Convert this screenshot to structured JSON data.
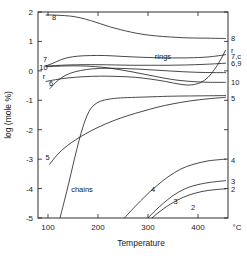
{
  "chart_data": {
    "type": "line",
    "title": "",
    "xlabel": "Temperature",
    "ylabel": "log (mole %)",
    "x_unit": "°C",
    "xlim": [
      80,
      460
    ],
    "ylim": [
      -5,
      2
    ],
    "grid": false,
    "legend_position": "curve-end-labels",
    "xticks": [
      100,
      200,
      300,
      400
    ],
    "xtick_labels": [
      "100",
      "200",
      "300",
      "400"
    ],
    "yticks": [
      2,
      1,
      0,
      -1,
      -2,
      -3,
      -4,
      -5
    ],
    "ytick_labels": [
      "2",
      "1",
      "0",
      "-1",
      "-2",
      "-3",
      "-4",
      "-5"
    ],
    "annotations": [
      {
        "text": "8",
        "x": 112,
        "y": 1.72
      },
      {
        "text": "rings",
        "x": 330,
        "y": 0.4
      },
      {
        "text": "chains",
        "x": 168,
        "y": -4.12
      },
      {
        "text": "7",
        "x": 94,
        "y": 0.3
      },
      {
        "text": "10",
        "x": 91,
        "y": 0.02
      },
      {
        "text": "r",
        "x": 92,
        "y": -0.28
      },
      {
        "text": "6",
        "x": 106,
        "y": -0.52
      },
      {
        "text": "5",
        "x": 99,
        "y": -3.02
      },
      {
        "text": "4",
        "x": 310,
        "y": -4.1
      },
      {
        "text": "3",
        "x": 355,
        "y": -4.54
      },
      {
        "text": "2",
        "x": 390,
        "y": -4.72
      }
    ],
    "right_edge_labels": [
      {
        "text": "8",
        "y": 1.1
      },
      {
        "text": "r",
        "y": 0.72
      },
      {
        "text": "7,c",
        "y": 0.52
      },
      {
        "text": "6,9",
        "y": 0.26
      },
      {
        "text": "10",
        "y": -0.38
      },
      {
        "text": "5",
        "y": -0.92
      },
      {
        "text": "4",
        "y": -3.02
      },
      {
        "text": "3",
        "y": -3.74
      },
      {
        "text": "2",
        "y": -4.02
      }
    ],
    "series": [
      {
        "name": "8",
        "label": "8",
        "points": [
          [
            96,
            1.9
          ],
          [
            120,
            1.89
          ],
          [
            145,
            1.86
          ],
          [
            165,
            1.8
          ],
          [
            185,
            1.71
          ],
          [
            205,
            1.6
          ],
          [
            225,
            1.49
          ],
          [
            245,
            1.4
          ],
          [
            265,
            1.32
          ],
          [
            290,
            1.24
          ],
          [
            315,
            1.19
          ],
          [
            345,
            1.15
          ],
          [
            380,
            1.12
          ],
          [
            420,
            1.11
          ],
          [
            455,
            1.1
          ]
        ]
      },
      {
        "name": "7,c",
        "label": "7,c",
        "points": [
          [
            96,
            0.17
          ],
          [
            110,
            0.26
          ],
          [
            125,
            0.37
          ],
          [
            140,
            0.45
          ],
          [
            160,
            0.5
          ],
          [
            185,
            0.52
          ],
          [
            215,
            0.52
          ],
          [
            250,
            0.49
          ],
          [
            290,
            0.46
          ],
          [
            330,
            0.44
          ],
          [
            370,
            0.44
          ],
          [
            410,
            0.46
          ],
          [
            435,
            0.5
          ],
          [
            455,
            0.55
          ]
        ]
      },
      {
        "name": "6,9",
        "label": "6,9",
        "points": [
          [
            96,
            0.16
          ],
          [
            115,
            0.18
          ],
          [
            140,
            0.2
          ],
          [
            170,
            0.21
          ],
          [
            200,
            0.21
          ],
          [
            235,
            0.2
          ],
          [
            270,
            0.19
          ],
          [
            305,
            0.19
          ],
          [
            340,
            0.19
          ],
          [
            375,
            0.2
          ],
          [
            410,
            0.22
          ],
          [
            435,
            0.24
          ],
          [
            455,
            0.26
          ]
        ]
      },
      {
        "name": "10",
        "label": "10",
        "points": [
          [
            96,
            0.14
          ],
          [
            120,
            0.16
          ],
          [
            150,
            0.17
          ],
          [
            180,
            0.16
          ],
          [
            210,
            0.12
          ],
          [
            240,
            0.05
          ],
          [
            270,
            -0.04
          ],
          [
            300,
            -0.14
          ],
          [
            330,
            -0.24
          ],
          [
            360,
            -0.32
          ],
          [
            395,
            -0.37
          ],
          [
            425,
            -0.39
          ],
          [
            455,
            -0.39
          ]
        ]
      },
      {
        "name": "6",
        "label": "6",
        "points": [
          [
            104,
            -0.6
          ],
          [
            115,
            -0.4
          ],
          [
            128,
            -0.22
          ],
          [
            145,
            -0.08
          ],
          [
            165,
            0.01
          ],
          [
            190,
            0.07
          ],
          [
            220,
            0.09
          ],
          [
            250,
            0.08
          ],
          [
            280,
            0.06
          ],
          [
            310,
            0.03
          ],
          [
            340,
            0.0
          ],
          [
            370,
            -0.03
          ],
          [
            400,
            -0.05
          ],
          [
            430,
            -0.06
          ],
          [
            455,
            -0.06
          ]
        ]
      },
      {
        "name": "5",
        "label": "5",
        "points": [
          [
            103,
            -3.18
          ],
          [
            115,
            -2.92
          ],
          [
            130,
            -2.66
          ],
          [
            150,
            -2.4
          ],
          [
            175,
            -2.14
          ],
          [
            200,
            -1.92
          ],
          [
            230,
            -1.7
          ],
          [
            260,
            -1.52
          ],
          [
            290,
            -1.37
          ],
          [
            320,
            -1.23
          ],
          [
            350,
            -1.12
          ],
          [
            385,
            -1.02
          ],
          [
            420,
            -0.95
          ],
          [
            455,
            -0.9
          ]
        ]
      },
      {
        "name": "chains",
        "label": "chains",
        "points": [
          [
            124,
            -5.0
          ],
          [
            133,
            -4.4
          ],
          [
            142,
            -3.78
          ],
          [
            150,
            -3.2
          ],
          [
            158,
            -2.64
          ],
          [
            166,
            -2.12
          ],
          [
            174,
            -1.7
          ],
          [
            182,
            -1.38
          ],
          [
            192,
            -1.16
          ],
          [
            205,
            -1.03
          ],
          [
            222,
            -0.96
          ],
          [
            245,
            -0.92
          ],
          [
            275,
            -0.9
          ],
          [
            310,
            -0.88
          ],
          [
            350,
            -0.86
          ],
          [
            400,
            -0.85
          ],
          [
            455,
            -0.84
          ]
        ]
      },
      {
        "name": "r",
        "label": "r",
        "points": [
          [
            96,
            -0.36
          ],
          [
            115,
            -0.3
          ],
          [
            140,
            -0.24
          ],
          [
            170,
            -0.2
          ],
          [
            205,
            -0.18
          ],
          [
            240,
            -0.19
          ],
          [
            275,
            -0.22
          ],
          [
            305,
            -0.28
          ],
          [
            335,
            -0.36
          ],
          [
            362,
            -0.45
          ],
          [
            385,
            -0.48
          ],
          [
            405,
            -0.4
          ],
          [
            420,
            -0.22
          ],
          [
            433,
            0.05
          ],
          [
            444,
            0.34
          ],
          [
            455,
            0.7
          ]
        ]
      },
      {
        "name": "4",
        "label": "4",
        "points": [
          [
            253,
            -5.0
          ],
          [
            268,
            -4.72
          ],
          [
            285,
            -4.42
          ],
          [
            303,
            -4.12
          ],
          [
            322,
            -3.84
          ],
          [
            342,
            -3.58
          ],
          [
            365,
            -3.34
          ],
          [
            390,
            -3.18
          ],
          [
            420,
            -3.06
          ],
          [
            455,
            -3.0
          ]
        ]
      },
      {
        "name": "3",
        "label": "3",
        "points": [
          [
            300,
            -5.0
          ],
          [
            315,
            -4.74
          ],
          [
            332,
            -4.48
          ],
          [
            350,
            -4.24
          ],
          [
            370,
            -4.04
          ],
          [
            392,
            -3.9
          ],
          [
            420,
            -3.8
          ],
          [
            455,
            -3.73
          ]
        ]
      },
      {
        "name": "2",
        "label": "2",
        "points": [
          [
            308,
            -5.0
          ],
          [
            322,
            -4.8
          ],
          [
            340,
            -4.58
          ],
          [
            360,
            -4.38
          ],
          [
            382,
            -4.22
          ],
          [
            408,
            -4.1
          ],
          [
            432,
            -4.04
          ],
          [
            455,
            -4.01
          ]
        ]
      }
    ]
  },
  "axes": {
    "x_title": "Temperature",
    "y_title": "log (mole %)",
    "unit_label": "°C"
  }
}
